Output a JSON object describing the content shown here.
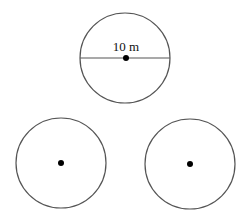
{
  "diagram": {
    "circles": [
      {
        "id": "top",
        "cx": 125,
        "cy": 58,
        "r": 45,
        "has_diameter": true,
        "label": "10 m"
      },
      {
        "id": "bottom-left",
        "cx": 61,
        "cy": 163,
        "r": 45,
        "has_diameter": false
      },
      {
        "id": "bottom-right",
        "cx": 190,
        "cy": 164,
        "r": 45,
        "has_diameter": false
      }
    ],
    "colors": {
      "stroke": "#555555",
      "center": "#000000",
      "background": "#ffffff"
    }
  }
}
